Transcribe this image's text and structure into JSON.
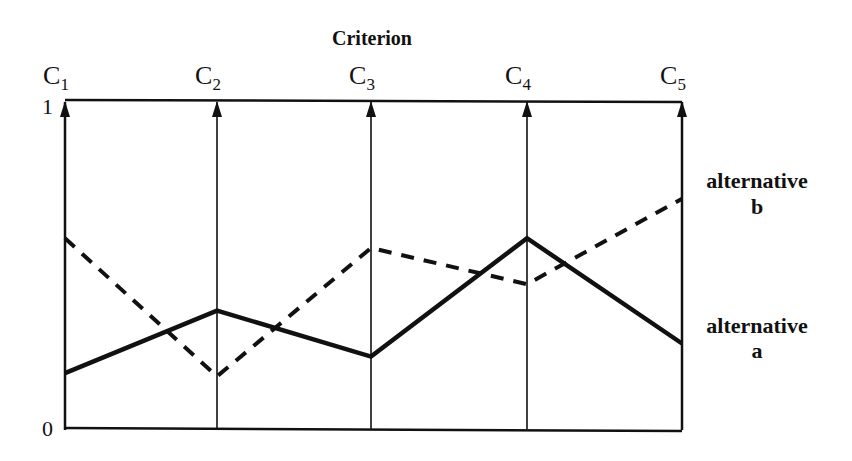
{
  "chart_data": {
    "type": "line",
    "subtype": "parallel-coordinates",
    "title": "Criterion",
    "categories": [
      "C1",
      "C2",
      "C3",
      "C4",
      "C5"
    ],
    "category_labels": [
      {
        "base": "C",
        "sub": "1"
      },
      {
        "base": "C",
        "sub": "2"
      },
      {
        "base": "C",
        "sub": "3"
      },
      {
        "base": "C",
        "sub": "4"
      },
      {
        "base": "C",
        "sub": "5"
      }
    ],
    "xlabel": "Criterion",
    "ylabel": "",
    "ylim": [
      0,
      1
    ],
    "y_ticks": [
      "0",
      "1"
    ],
    "grid": false,
    "legend_position": "right (inline labels)",
    "series": [
      {
        "name": "alternative a",
        "label_line1": "alternative",
        "label_line2": "a",
        "style": "solid",
        "values": [
          0.17,
          0.36,
          0.22,
          0.58,
          0.26
        ]
      },
      {
        "name": "alternative b",
        "label_line1": "alternative",
        "label_line2": "b",
        "style": "dashed",
        "values": [
          0.58,
          0.16,
          0.55,
          0.44,
          0.7
        ]
      }
    ]
  },
  "colors": {
    "line": "#111111",
    "background": "#ffffff"
  }
}
